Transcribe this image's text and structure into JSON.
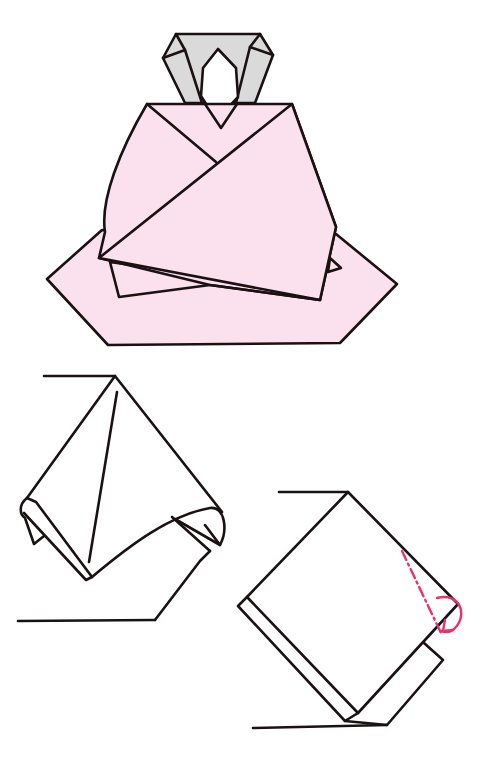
{
  "figure": {
    "title": "Origami seated figure folding diagram",
    "colors": {
      "paper_pink": "#fbe0ee",
      "paper_gray": "#dadada",
      "line": "#1a1212",
      "arrow_red": "#e8326a",
      "background": "#ffffff"
    },
    "steps": [
      {
        "id": "finished-model",
        "description": "Completed seated doll with gray hood/head and pink kimono body"
      },
      {
        "id": "step-a",
        "description": "Paper corner curled forward with creased flap"
      },
      {
        "id": "step-b",
        "description": "Square flap with red valley-fold line and fold-behind arrow"
      }
    ],
    "symbols": [
      {
        "id": "mountain-fold-line",
        "style": "dash-dot",
        "color": "#e8326a"
      },
      {
        "id": "fold-behind-arrow",
        "color": "#e8326a"
      }
    ]
  }
}
